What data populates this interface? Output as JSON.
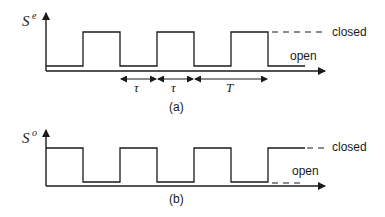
{
  "figure": {
    "panel_a": {
      "y_label": "S",
      "y_label_superscript": "e",
      "state_labels": {
        "high": "closed",
        "low": "open"
      },
      "intervals": [
        {
          "label": "τ"
        },
        {
          "label": "τ"
        },
        {
          "label": "T"
        }
      ],
      "caption": "(a)"
    },
    "panel_b": {
      "y_label": "S",
      "y_label_superscript": "o",
      "state_labels": {
        "high": "closed",
        "low": "open"
      },
      "caption": "(b)"
    },
    "colors": {
      "ink": "#1a1a1a",
      "background": "#ffffff"
    }
  }
}
